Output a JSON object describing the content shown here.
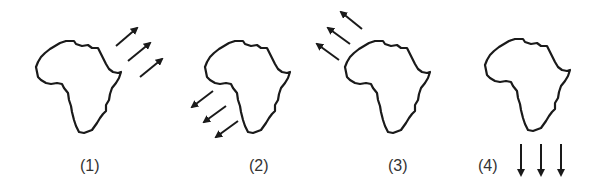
{
  "figure": {
    "panels": [
      {
        "label": "(1)",
        "arrow_direction": "north-east",
        "arrow_position": "east of continent"
      },
      {
        "label": "(2)",
        "arrow_direction": "south-west",
        "arrow_position": "south-west of continent"
      },
      {
        "label": "(3)",
        "arrow_direction": "north-west",
        "arrow_position": "north-west of continent"
      },
      {
        "label": "(4)",
        "arrow_direction": "south",
        "arrow_position": "below continent"
      }
    ],
    "colors": {
      "outline": "#1a1a1a",
      "arrows": "#1a1a1a",
      "label": "#333333",
      "background": "#ffffff"
    }
  }
}
